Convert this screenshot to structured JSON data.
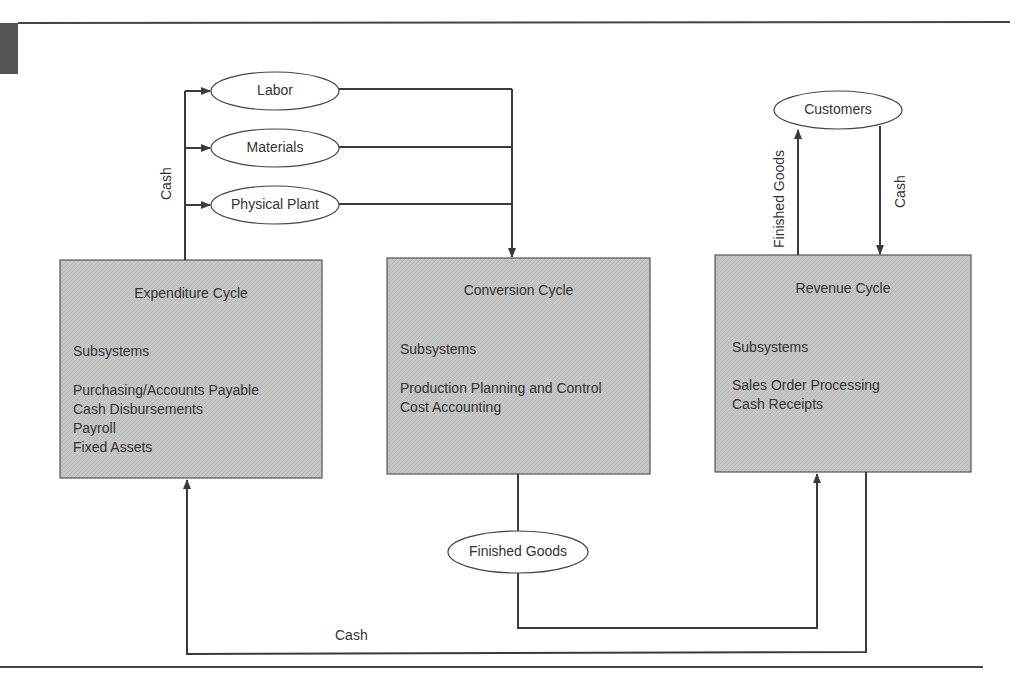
{
  "diagram": {
    "type": "flow-diagram",
    "title": "",
    "colors": {
      "box_fill": "#c4c4c4",
      "line": "#3a3a3a",
      "text": "#333333",
      "corner_block": "#555555"
    },
    "inputs": {
      "labor": "Labor",
      "materials": "Materials",
      "physical_plant": "Physical Plant",
      "cash_label": "Cash"
    },
    "cycles": {
      "expenditure": {
        "title": "Expenditure Cycle",
        "subsystems_heading": "Subsystems",
        "subsystems": [
          "Purchasing/Accounts Payable",
          "Cash Disbursements",
          "Payroll",
          "Fixed Assets"
        ]
      },
      "conversion": {
        "title": "Conversion Cycle",
        "subsystems_heading": "Subsystems",
        "subsystems": [
          "Production Planning and Control",
          "Cost Accounting"
        ]
      },
      "revenue": {
        "title": "Revenue Cycle",
        "subsystems_heading": "Subsystems",
        "subsystems": [
          "Sales Order Processing",
          "Cash Receipts"
        ]
      }
    },
    "customers": {
      "label": "Customers",
      "to_customers_label": "Finished Goods",
      "from_customers_label": "Cash"
    },
    "finished_goods": {
      "label": "Finished Goods"
    },
    "bottom_cash_label": "Cash"
  }
}
